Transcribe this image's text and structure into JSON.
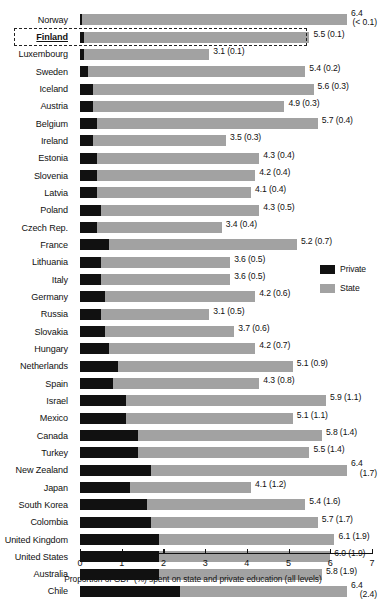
{
  "chart_data": {
    "type": "bar",
    "orientation": "horizontal",
    "stacked": true,
    "title": "",
    "xlabel": "Proportion of GDP (%) spent on state and private education (all levels)",
    "ylabel": "",
    "xlim": [
      0,
      7
    ],
    "xticks": [
      "0",
      "1",
      "2",
      "3",
      "4",
      "5",
      "6",
      "7"
    ],
    "grid": false,
    "legend_position": "right-middle",
    "series": [
      {
        "name": "Private",
        "color": "#111111"
      },
      {
        "name": "State",
        "color": "#a2a2a2"
      }
    ],
    "categories": [
      "Norway",
      "Finland",
      "Luxembourg",
      "Sweden",
      "Iceland",
      "Austria",
      "Belgium",
      "Ireland",
      "Estonia",
      "Slovenia",
      "Latvia",
      "Poland",
      "Czech Rep.",
      "France",
      "Lithuania",
      "Italy",
      "Germany",
      "Russia",
      "Slovakia",
      "Hungary",
      "Netherlands",
      "Spain",
      "Israel",
      "Mexico",
      "Canada",
      "Turkey",
      "New Zealand",
      "Japan",
      "South Korea",
      "Colombia",
      "United Kingdom",
      "United States",
      "Australia",
      "Chile"
    ],
    "rows": [
      {
        "label": "Norway",
        "total": 6.4,
        "private": 0.05,
        "value_text": "6.4",
        "paren_text": "(< 0.1)",
        "two_line": true,
        "highlight": false
      },
      {
        "label": "Finland",
        "total": 5.5,
        "private": 0.1,
        "value_text": "5.5 (0.1)",
        "paren_text": "",
        "two_line": false,
        "highlight": true
      },
      {
        "label": "Luxembourg",
        "total": 3.1,
        "private": 0.1,
        "value_text": "3.1 (0.1)",
        "paren_text": "",
        "two_line": false,
        "highlight": false
      },
      {
        "label": "Sweden",
        "total": 5.4,
        "private": 0.2,
        "value_text": "5.4 (0.2)",
        "paren_text": "",
        "two_line": false,
        "highlight": false
      },
      {
        "label": "Iceland",
        "total": 5.6,
        "private": 0.3,
        "value_text": "5.6 (0.3)",
        "paren_text": "",
        "two_line": false,
        "highlight": false
      },
      {
        "label": "Austria",
        "total": 4.9,
        "private": 0.3,
        "value_text": "4.9 (0.3)",
        "paren_text": "",
        "two_line": false,
        "highlight": false
      },
      {
        "label": "Belgium",
        "total": 5.7,
        "private": 0.4,
        "value_text": "5.7 (0.4)",
        "paren_text": "",
        "two_line": false,
        "highlight": false
      },
      {
        "label": "Ireland",
        "total": 3.5,
        "private": 0.3,
        "value_text": "3.5 (0.3)",
        "paren_text": "",
        "two_line": false,
        "highlight": false
      },
      {
        "label": "Estonia",
        "total": 4.3,
        "private": 0.4,
        "value_text": "4.3 (0.4)",
        "paren_text": "",
        "two_line": false,
        "highlight": false
      },
      {
        "label": "Slovenia",
        "total": 4.2,
        "private": 0.4,
        "value_text": "4.2 (0.4)",
        "paren_text": "",
        "two_line": false,
        "highlight": false
      },
      {
        "label": "Latvia",
        "total": 4.1,
        "private": 0.4,
        "value_text": "4.1 (0.4)",
        "paren_text": "",
        "two_line": false,
        "highlight": false
      },
      {
        "label": "Poland",
        "total": 4.3,
        "private": 0.5,
        "value_text": "4.3 (0.5)",
        "paren_text": "",
        "two_line": false,
        "highlight": false
      },
      {
        "label": "Czech Rep.",
        "total": 3.4,
        "private": 0.4,
        "value_text": "3.4 (0.4)",
        "paren_text": "",
        "two_line": false,
        "highlight": false
      },
      {
        "label": "France",
        "total": 5.2,
        "private": 0.7,
        "value_text": "5.2 (0.7)",
        "paren_text": "",
        "two_line": false,
        "highlight": false
      },
      {
        "label": "Lithuania",
        "total": 3.6,
        "private": 0.5,
        "value_text": "3.6 (0.5)",
        "paren_text": "",
        "two_line": false,
        "highlight": false
      },
      {
        "label": "Italy",
        "total": 3.6,
        "private": 0.5,
        "value_text": "3.6 (0.5)",
        "paren_text": "",
        "two_line": false,
        "highlight": false
      },
      {
        "label": "Germany",
        "total": 4.2,
        "private": 0.6,
        "value_text": "4.2 (0.6)",
        "paren_text": "",
        "two_line": false,
        "highlight": false
      },
      {
        "label": "Russia",
        "total": 3.1,
        "private": 0.5,
        "value_text": "3.1 (0.5)",
        "paren_text": "",
        "two_line": false,
        "highlight": false
      },
      {
        "label": "Slovakia",
        "total": 3.7,
        "private": 0.6,
        "value_text": "3.7 (0.6)",
        "paren_text": "",
        "two_line": false,
        "highlight": false
      },
      {
        "label": "Hungary",
        "total": 4.2,
        "private": 0.7,
        "value_text": "4.2 (0.7)",
        "paren_text": "",
        "two_line": false,
        "highlight": false
      },
      {
        "label": "Netherlands",
        "total": 5.1,
        "private": 0.9,
        "value_text": "5.1 (0.9)",
        "paren_text": "",
        "two_line": false,
        "highlight": false
      },
      {
        "label": "Spain",
        "total": 4.3,
        "private": 0.8,
        "value_text": "4.3 (0.8)",
        "paren_text": "",
        "two_line": false,
        "highlight": false
      },
      {
        "label": "Israel",
        "total": 5.9,
        "private": 1.1,
        "value_text": "5.9 (1.1)",
        "paren_text": "",
        "two_line": false,
        "highlight": false
      },
      {
        "label": "Mexico",
        "total": 5.1,
        "private": 1.1,
        "value_text": "5.1 (1.1)",
        "paren_text": "",
        "two_line": false,
        "highlight": false
      },
      {
        "label": "Canada",
        "total": 5.8,
        "private": 1.4,
        "value_text": "5.8 (1.4)",
        "paren_text": "",
        "two_line": false,
        "highlight": false
      },
      {
        "label": "Turkey",
        "total": 5.5,
        "private": 1.4,
        "value_text": "5.5 (1.4)",
        "paren_text": "",
        "two_line": false,
        "highlight": false
      },
      {
        "label": "New Zealand",
        "total": 6.4,
        "private": 1.7,
        "value_text": "6.4",
        "paren_text": "(1.7)",
        "two_line": true,
        "highlight": false
      },
      {
        "label": "Japan",
        "total": 4.1,
        "private": 1.2,
        "value_text": "4.1 (1.2)",
        "paren_text": "",
        "two_line": false,
        "highlight": false
      },
      {
        "label": "South Korea",
        "total": 5.4,
        "private": 1.6,
        "value_text": "5.4 (1.6)",
        "paren_text": "",
        "two_line": false,
        "highlight": false
      },
      {
        "label": "Colombia",
        "total": 5.7,
        "private": 1.7,
        "value_text": "5.7 (1.7)",
        "paren_text": "",
        "two_line": false,
        "highlight": false
      },
      {
        "label": "United Kingdom",
        "total": 6.1,
        "private": 1.9,
        "value_text": "6.1 (1.9)",
        "paren_text": "",
        "two_line": false,
        "highlight": false
      },
      {
        "label": "United States",
        "total": 6.0,
        "private": 1.9,
        "value_text": "6.0 (1.9)",
        "paren_text": "",
        "two_line": false,
        "highlight": false
      },
      {
        "label": "Australia",
        "total": 5.8,
        "private": 1.9,
        "value_text": "5.8 (1.9)",
        "paren_text": "",
        "two_line": false,
        "highlight": false
      },
      {
        "label": "Chile",
        "total": 6.4,
        "private": 2.4,
        "value_text": "6.4",
        "paren_text": "(2.4)",
        "two_line": true,
        "highlight": false
      }
    ]
  },
  "legend": {
    "items": [
      {
        "label": "Private",
        "color": "#111111"
      },
      {
        "label": "State",
        "color": "#a2a2a2"
      }
    ]
  },
  "axis": {
    "title": "Proportion of GDP (%) spent on state and private education (all levels)",
    "ticks": [
      "0",
      "1",
      "2",
      "3",
      "4",
      "5",
      "6",
      "7"
    ]
  }
}
